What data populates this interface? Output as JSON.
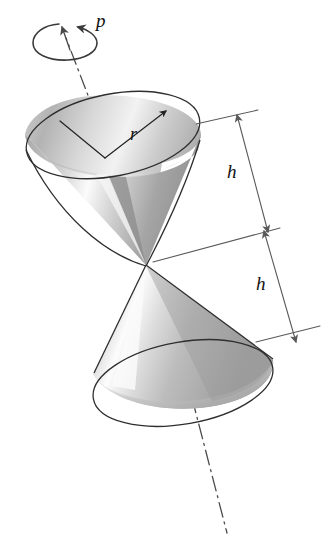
{
  "figure": {
    "background_color": "#ffffff",
    "labels": {
      "spin": "p",
      "radius": "r",
      "height_upper": "h",
      "height_lower": "h"
    },
    "annotations": [
      {
        "name": "spin-axis",
        "kind": "dash-dot-centerline",
        "note": "axis through both cone apexes, arrowhead at top"
      },
      {
        "name": "spin-arrow",
        "kind": "curved-rotation-arrow",
        "note": "elliptical arrow encircling the axis near the top"
      },
      {
        "name": "radius-dimension",
        "kind": "leader-line",
        "note": "from center of upper cone rim to the rim edge"
      },
      {
        "name": "height-dimension-upper",
        "kind": "double-arrow",
        "note": "from upper cone rim plane down to the shared apex"
      },
      {
        "name": "height-dimension-lower",
        "kind": "double-arrow",
        "note": "from shared apex down to lower cone base plane"
      }
    ],
    "geometry": {
      "upper_cone": {
        "orientation": "open rim up-left, apex down-right",
        "rim_center": [
          111,
          150
        ],
        "rim_rx": 91,
        "rim_ry": 42,
        "rim_rotation_deg": -23,
        "apex": [
          146,
          265
        ]
      },
      "lower_cone": {
        "orientation": "apex up-left, base rim down-right",
        "base_center": [
          181,
          378
        ],
        "base_rx": 92,
        "base_ry": 44,
        "base_rotation_deg": -20,
        "apex": [
          146,
          265
        ]
      },
      "axis_top_point": [
        64,
        30
      ],
      "axis_bottom_point": [
        225,
        530
      ]
    },
    "colors": {
      "outline": "#2e2e2e",
      "dimension": "#5a5a5a",
      "label_text": "#111111",
      "shade_light": "#fdfdfd",
      "shade_mid": "#b9b9b9",
      "shade_dark": "#8c8c8c"
    }
  }
}
